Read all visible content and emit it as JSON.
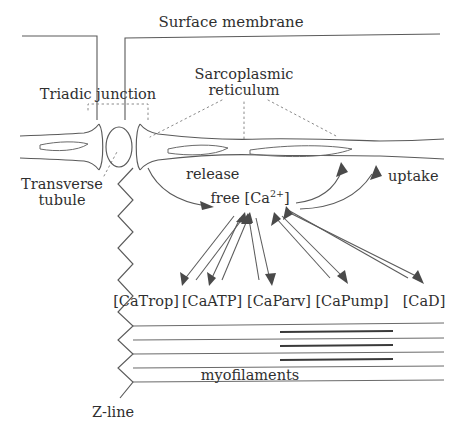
{
  "figure": {
    "title_top": "Surface membrane",
    "labels": {
      "triadic_junction": "Triadic junction",
      "sarcoplasmic_reticulum_line1": "Sarcoplasmic",
      "sarcoplasmic_reticulum_line2": "reticulum",
      "transverse_tubule_line1": "Transverse",
      "transverse_tubule_line2": "tubule",
      "release": "release",
      "uptake": "uptake",
      "free_calcium_prefix": "free [Ca",
      "free_calcium_charge": "2+",
      "free_calcium_suffix": "]",
      "z_line": "Z-line",
      "myofilaments": "myofilaments"
    },
    "buffers": [
      {
        "label": "[CaTrop]"
      },
      {
        "label": "[CaATP]"
      },
      {
        "label": "[CaParv]"
      },
      {
        "label": "[CaPump]"
      },
      {
        "label": "[CaD]"
      }
    ],
    "colors": {
      "background": "#ffffff",
      "ink": "#2f2f2f",
      "line": "#5a5a5a",
      "thick_filament": "#3a3a3a",
      "dotted_leader": "#8a8a8a"
    }
  }
}
